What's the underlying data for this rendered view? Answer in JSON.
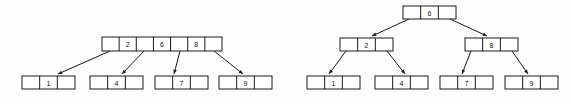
{
  "figure": {
    "background_color": "#fdfdfd",
    "stroke_color": "#1a1a1a",
    "fill_color": "#ffffff",
    "width": 571,
    "height": 104
  },
  "diagrams": [
    {
      "id": "left-tree",
      "name": "two-level-btree",
      "levels": 2,
      "nodes": [
        {
          "id": "left-root",
          "name": "root-node",
          "level": 0,
          "x": 102,
          "y": 37,
          "width": 120,
          "height": 14,
          "cell_count": 7,
          "cells": [
            "",
            "2",
            "",
            "6",
            "",
            "8",
            ""
          ],
          "keys": [
            "2",
            "6",
            "8"
          ]
        },
        {
          "id": "left-leaf-1",
          "name": "leaf-node",
          "level": 1,
          "x": 22,
          "y": 76,
          "width": 53,
          "height": 13,
          "cell_count": 3,
          "cells": [
            "",
            "1",
            ""
          ],
          "keys": [
            "1"
          ]
        },
        {
          "id": "left-leaf-2",
          "name": "leaf-node",
          "level": 1,
          "x": 90,
          "y": 76,
          "width": 53,
          "height": 13,
          "cell_count": 3,
          "cells": [
            "",
            "4",
            ""
          ],
          "keys": [
            "4"
          ]
        },
        {
          "id": "left-leaf-3",
          "name": "leaf-node",
          "level": 1,
          "x": 155,
          "y": 76,
          "width": 53,
          "height": 13,
          "cell_count": 3,
          "cells": [
            "",
            "7",
            ""
          ],
          "keys": [
            "7"
          ]
        },
        {
          "id": "left-leaf-4",
          "name": "leaf-node",
          "level": 1,
          "x": 219,
          "y": 76,
          "width": 53,
          "height": 13,
          "cell_count": 3,
          "cells": [
            "",
            "9",
            ""
          ],
          "keys": [
            "9"
          ]
        }
      ],
      "edges": [
        {
          "name": "pointer-arrow",
          "from": [
            110,
            51
          ],
          "to": [
            58,
            74
          ]
        },
        {
          "name": "pointer-arrow",
          "from": [
            144,
            51
          ],
          "to": [
            122,
            74
          ]
        },
        {
          "name": "pointer-arrow",
          "from": [
            180,
            51
          ],
          "to": [
            174,
            74
          ]
        },
        {
          "name": "pointer-arrow",
          "from": [
            214,
            51
          ],
          "to": [
            243,
            74
          ]
        }
      ]
    },
    {
      "id": "right-tree",
      "name": "three-level-btree",
      "levels": 3,
      "nodes": [
        {
          "id": "right-root",
          "name": "root-node",
          "level": 0,
          "x": 403,
          "y": 6,
          "width": 53,
          "height": 13,
          "cell_count": 3,
          "cells": [
            "",
            "6",
            ""
          ],
          "keys": [
            "6"
          ]
        },
        {
          "id": "right-internal-left",
          "name": "internal-node",
          "level": 1,
          "x": 340,
          "y": 38,
          "width": 53,
          "height": 13,
          "cell_count": 3,
          "cells": [
            "",
            "2",
            ""
          ],
          "keys": [
            "2"
          ]
        },
        {
          "id": "right-internal-right",
          "name": "internal-node",
          "level": 1,
          "x": 465,
          "y": 38,
          "width": 53,
          "height": 13,
          "cell_count": 3,
          "cells": [
            "",
            "8",
            ""
          ],
          "keys": [
            "8"
          ]
        },
        {
          "id": "right-leaf-1",
          "name": "leaf-node",
          "level": 2,
          "x": 307,
          "y": 76,
          "width": 53,
          "height": 13,
          "cell_count": 3,
          "cells": [
            "",
            "1",
            ""
          ],
          "keys": [
            "1"
          ]
        },
        {
          "id": "right-leaf-2",
          "name": "leaf-node",
          "level": 2,
          "x": 375,
          "y": 76,
          "width": 53,
          "height": 13,
          "cell_count": 3,
          "cells": [
            "",
            "4",
            ""
          ],
          "keys": [
            "4"
          ]
        },
        {
          "id": "right-leaf-3",
          "name": "leaf-node",
          "level": 2,
          "x": 440,
          "y": 76,
          "width": 53,
          "height": 13,
          "cell_count": 3,
          "cells": [
            "",
            "7",
            ""
          ],
          "keys": [
            "7"
          ]
        },
        {
          "id": "right-leaf-4",
          "name": "leaf-node",
          "level": 2,
          "x": 505,
          "y": 76,
          "width": 53,
          "height": 13,
          "cell_count": 3,
          "cells": [
            "",
            "9",
            ""
          ],
          "keys": [
            "9"
          ]
        }
      ],
      "edges": [
        {
          "name": "pointer-arrow",
          "from": [
            409,
            19
          ],
          "to": [
            372,
            36
          ]
        },
        {
          "name": "pointer-arrow",
          "from": [
            450,
            19
          ],
          "to": [
            487,
            36
          ]
        },
        {
          "name": "pointer-arrow",
          "from": [
            346,
            51
          ],
          "to": [
            329,
            74
          ]
        },
        {
          "name": "pointer-arrow",
          "from": [
            387,
            51
          ],
          "to": [
            405,
            74
          ]
        },
        {
          "name": "pointer-arrow",
          "from": [
            471,
            51
          ],
          "to": [
            462,
            74
          ]
        },
        {
          "name": "pointer-arrow",
          "from": [
            512,
            51
          ],
          "to": [
            528,
            74
          ]
        }
      ]
    }
  ]
}
